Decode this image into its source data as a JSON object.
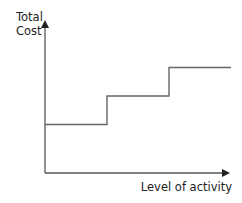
{
  "chart_data": {
    "type": "line",
    "title": "",
    "ylabel": "Total Cost",
    "ylabel_lines": [
      "Total",
      "Cost"
    ],
    "xlabel": "Level of activity",
    "grid": false,
    "legend": null,
    "line_color": "#666666",
    "axis_color": "#555555",
    "step": true,
    "series": [
      {
        "name": "Total Cost (stepped fixed cost)",
        "points": [
          {
            "x": 0,
            "y": 1
          },
          {
            "x": 1,
            "y": 1
          },
          {
            "x": 1,
            "y": 2
          },
          {
            "x": 2,
            "y": 2
          },
          {
            "x": 2,
            "y": 3
          },
          {
            "x": 3,
            "y": 3
          }
        ]
      }
    ],
    "xlim": [
      0,
      3.2
    ],
    "ylim": [
      0,
      5.4
    ]
  }
}
